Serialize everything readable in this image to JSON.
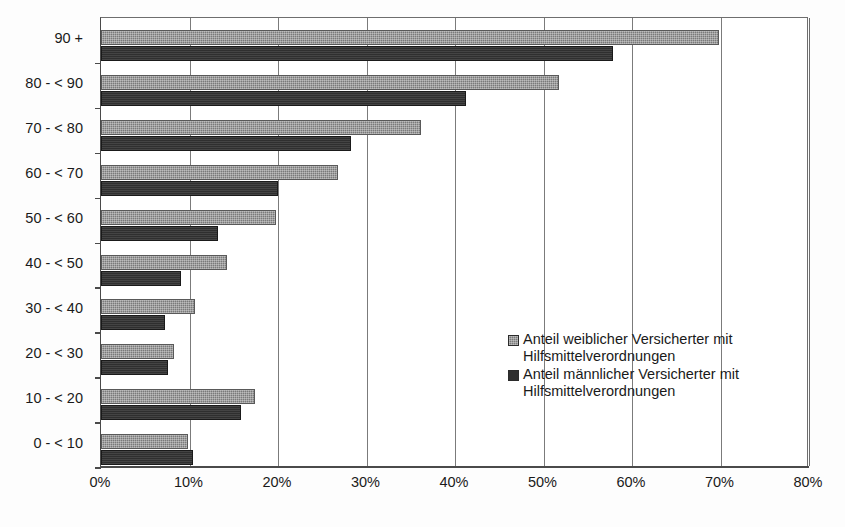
{
  "chart_data": {
    "type": "bar",
    "orientation": "horizontal",
    "title": "",
    "subtitle": "",
    "xlabel": "",
    "ylabel": "",
    "xlim": [
      0,
      80
    ],
    "ylim": null,
    "grid": true,
    "legend_position": "inside-right",
    "x_tick_labels": [
      "0%",
      "10%",
      "20%",
      "30%",
      "40%",
      "50%",
      "60%",
      "70%",
      "80%"
    ],
    "x_tick_values": [
      0,
      10,
      20,
      30,
      40,
      50,
      60,
      70,
      80
    ],
    "categories": [
      "90 +",
      "80 - < 90",
      "70 - < 80",
      "60 - < 70",
      "50 - < 60",
      "40 - < 50",
      "30 - < 40",
      "20 - < 30",
      "10 - < 20",
      "0 - < 10"
    ],
    "series": [
      {
        "name": "Anteil weiblicher Versicherter mit Hilfsmittelverordnungen",
        "color": "#7a7a7a",
        "values": [
          69.8,
          51.8,
          36.2,
          26.8,
          19.8,
          14.2,
          10.6,
          8.2,
          17.4,
          9.8
        ]
      },
      {
        "name": "Anteil männlicher Versicherter mit Hilfsmittelverordnungen",
        "color": "#2f2f2f",
        "values": [
          57.8,
          41.2,
          28.2,
          20.0,
          13.2,
          9.0,
          7.2,
          7.6,
          15.8,
          10.4
        ]
      }
    ],
    "legend": [
      {
        "label": "Anteil weiblicher Versicherter mit Hilfsmittelverordnungen",
        "swatch": "#7a7a7a"
      },
      {
        "label": "Anteil männlicher Versicherter mit Hilfsmittelverordnungen",
        "swatch": "#2f2f2f"
      }
    ]
  }
}
